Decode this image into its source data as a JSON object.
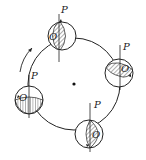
{
  "diagram": {
    "center_point": "fixed center",
    "rotation_arrow": "clockwise-direction arrow on left side",
    "disks": [
      {
        "id": "top",
        "force_label": "P",
        "point_label": "O",
        "hatch": "diagonal"
      },
      {
        "id": "right",
        "force_label": "P",
        "point_label": "O",
        "hatch": "diagonal"
      },
      {
        "id": "bottom",
        "force_label": "P",
        "point_label": "O",
        "hatch": "diagonal"
      },
      {
        "id": "left",
        "force_label": "P",
        "point_label": "O",
        "hatch": "vertical"
      }
    ]
  },
  "colors": {
    "stroke": "#222222",
    "background": "#ffffff"
  }
}
